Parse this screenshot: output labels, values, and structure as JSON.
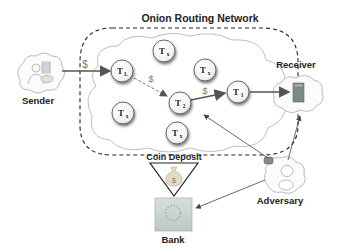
{
  "diagram": {
    "title": "Onion Routing Network",
    "actors": {
      "sender": "Sender",
      "receiver": "Receiver",
      "adversary": "Adversary",
      "bank": "Bank",
      "coin_deposit": "Coin Deposit"
    },
    "nodes": [
      {
        "id": "TL",
        "label": "T",
        "sub": "L"
      },
      {
        "id": "Tx1",
        "label": "T",
        "sub": "x"
      },
      {
        "id": "Tx2",
        "label": "T",
        "sub": "x"
      },
      {
        "id": "Tx3",
        "label": "T",
        "sub": "x"
      },
      {
        "id": "T2",
        "label": "T",
        "sub": "2"
      },
      {
        "id": "Tx4",
        "label": "T",
        "sub": "x"
      },
      {
        "id": "T1",
        "label": "T",
        "sub": "1"
      }
    ],
    "edges": [
      {
        "from": "Sender",
        "to": "TL",
        "label": "$",
        "style": "solid"
      },
      {
        "from": "TL",
        "to": "T2",
        "label": "$",
        "style": "dashed"
      },
      {
        "from": "T2",
        "to": "T1",
        "label": "$",
        "style": "solid"
      },
      {
        "from": "T1",
        "to": "Receiver",
        "label": "",
        "style": "solid"
      },
      {
        "from": "Adversary",
        "to": "T2",
        "label": "",
        "style": "thin"
      },
      {
        "from": "Adversary",
        "to": "Receiver",
        "label": "",
        "style": "thin"
      },
      {
        "from": "Adversary",
        "to": "Bank",
        "label": "",
        "style": "thin"
      },
      {
        "from": "Coin Deposit",
        "to": "Bank",
        "label": "",
        "style": "solid"
      }
    ],
    "money_symbol": "$",
    "colors": {
      "arrow": "#555555",
      "dashed_border": "#222222",
      "cloud_stroke": "#aaaaaa",
      "bank_fill": "#c9d6cf",
      "receiver_device": "#7b8a86"
    }
  }
}
